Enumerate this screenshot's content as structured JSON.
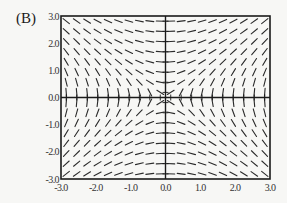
{
  "panel_label": "(B)",
  "colors": {
    "axis": "#1a1a1a",
    "segment": "#2a2a2a",
    "background": "#f7f7f5"
  },
  "chart_data": {
    "type": "slope_field",
    "title": "",
    "differential_equation_pattern": "dy/dx = x/y",
    "xlabel": "",
    "ylabel": "",
    "xlim": [
      -3.0,
      3.0
    ],
    "ylim": [
      -3.0,
      3.0
    ],
    "x_ticks": [
      "-3.0",
      "-2.0",
      "-1.0",
      "0.0",
      "1.0",
      "2.0",
      "3.0"
    ],
    "y_ticks": [
      "-3.0",
      "-2.0",
      "-1.0",
      "0.0",
      "1.0",
      "2.0",
      "3.0"
    ],
    "grid": false,
    "axes_through_origin": true,
    "segment_grid": {
      "nx": 20,
      "ny": 16,
      "segment_length_px": 8
    }
  }
}
